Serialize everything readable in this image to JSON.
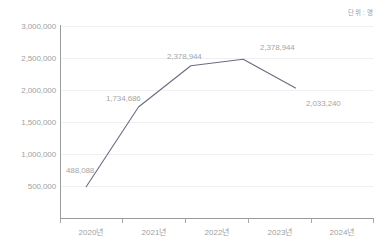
{
  "unit_caption": "단위 : 명",
  "chart_data": {
    "type": "line",
    "title": "",
    "subtitle": "",
    "xlabel": "",
    "ylabel": "",
    "unit": "단위 : 명",
    "grid": true,
    "legend": "none",
    "categories": [
      "2020년",
      "2021년",
      "2022년",
      "2023년",
      "2024년"
    ],
    "values": [
      488088,
      1734686,
      2378944,
      2478944,
      2033240
    ],
    "point_labels": [
      "488,088",
      "1,734,686",
      "2,378,944",
      "2,378,944",
      "2,033,240"
    ],
    "series": [
      {
        "name": "",
        "color": "#6b6b80",
        "values": [
          488088,
          1734686,
          2378944,
          2478944,
          2033240
        ]
      }
    ],
    "ylim": [
      0,
      3000000
    ],
    "ytick_values": [
      500000,
      1000000,
      1500000,
      2000000,
      2500000,
      3000000
    ],
    "ytick_labels": [
      "500,000",
      "1,000,000",
      "1,500,000",
      "2,000,000",
      "2,500,000",
      "3,000,000"
    ],
    "xtick_labels": [
      "2020년",
      "2021년",
      "2022년",
      "2023년",
      "2024년"
    ]
  },
  "axis": {
    "y_labels": [
      "3,000,000",
      "2,500,000",
      "2,000,000",
      "1,500,000",
      "1,000,000",
      "500,000"
    ],
    "x_labels": [
      "2020년",
      "2021년",
      "2022년",
      "2023년",
      "2024년"
    ]
  },
  "labels": {
    "p0": "488,088",
    "p1": "1,734,686",
    "p2": "2,378,944",
    "p3": "2,378,944",
    "p4": "2,033,240"
  },
  "colors": {
    "line": "#6b6b80",
    "axis": "#9b9b9b",
    "grid": "#f0f0f2",
    "text": "#a0a0a0",
    "background": "#ffffff"
  }
}
